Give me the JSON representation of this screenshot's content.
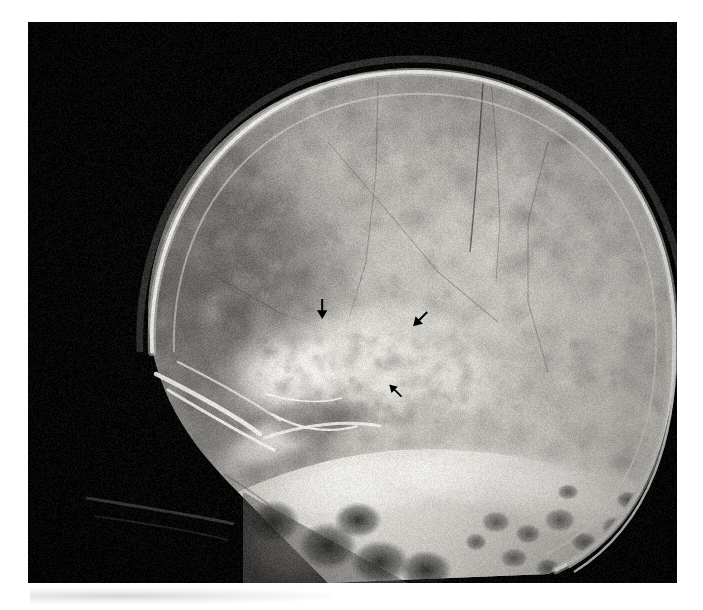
{
  "figure": {
    "kind": "radiograph",
    "modality": "plain film radiograph",
    "view": "lateral skull",
    "plate": {
      "left": 28,
      "top": 22,
      "width": 649,
      "height": 561,
      "background_color": "#050505",
      "border_color": "#000000"
    },
    "page_background_color": "#ffffff",
    "tone": {
      "film_black": "#060606",
      "soft_tissue_gray": "#6e6e6e",
      "calvarium_gray": "#b4b2ae",
      "diploe_light": "#cfcdc8",
      "cortical_white": "#f2f0ec",
      "sclerotic_highlight": "#fbfaf7"
    }
  },
  "anatomy": {
    "regions": [
      {
        "name": "frontal-bone",
        "label": "Frontal bone / anterior calvarium"
      },
      {
        "name": "parietal-bone",
        "label": "Parietal bone / calvarial vault"
      },
      {
        "name": "occipital-bone",
        "label": "Occipital bone"
      },
      {
        "name": "coronal-suture",
        "label": "Coronal suture"
      },
      {
        "name": "orbital-roof",
        "label": "Orbital roof"
      },
      {
        "name": "sphenoid-wing",
        "label": "Greater wing of sphenoid"
      },
      {
        "name": "sella-turcica",
        "label": "Sella turcica"
      },
      {
        "name": "petrous-ridge",
        "label": "Petrous ridge"
      },
      {
        "name": "mastoid-air-cells",
        "label": "Mastoid air cells"
      },
      {
        "name": "skull-base",
        "label": "Skull base"
      },
      {
        "name": "cervical-spine",
        "label": "Upper cervical spine"
      },
      {
        "name": "scalp-soft-tissue",
        "label": "Scalp soft tissue margin"
      }
    ],
    "finding": {
      "name": "middle-cranial-fossa-lesion",
      "description": "Mixed sclerotic and lucent lesion of the central skull base marked by three arrows"
    }
  },
  "annotations": {
    "color": "#000000",
    "arrows": [
      {
        "id": "arrow-1",
        "name": "annotation-arrow-superior-left",
        "direction": "down",
        "x": 311,
        "y": 298,
        "size": 22,
        "rotation": 0,
        "points_to": "superior margin of lesion"
      },
      {
        "id": "arrow-2",
        "name": "annotation-arrow-superior-right",
        "direction": "down-left",
        "x": 409,
        "y": 308,
        "size": 22,
        "rotation": 45,
        "points_to": "posterior-superior margin of lesion"
      },
      {
        "id": "arrow-3",
        "name": "annotation-arrow-inferior",
        "direction": "up-left",
        "x": 386,
        "y": 381,
        "size": 19,
        "rotation": 135,
        "points_to": "inferior margin of lesion"
      }
    ]
  }
}
